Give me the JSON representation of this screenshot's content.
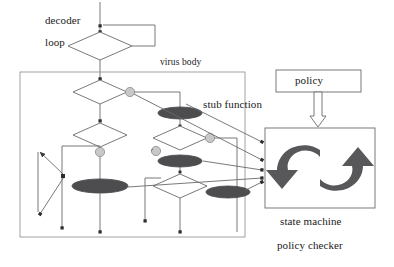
{
  "diagram": {
    "type": "flowchart",
    "labels": {
      "decoder": "decoder",
      "loop": "loop",
      "virus_body": "virus body",
      "stub_function": "stub function",
      "policy": "policy",
      "state_machine": "state machine",
      "policy_checker": "policy checker"
    },
    "colors": {
      "line": "#58585a",
      "stroke_dark": "#2b2b2b",
      "ellipse_fill": "#4d4d4f",
      "circle_fill": "#bfbfbf",
      "box_fill": "#ffffff",
      "arrow_icon": "#58585a",
      "text": "#1a1a1a"
    },
    "nodes": {
      "decoder_loop_diamond": {
        "cx": 100,
        "cy": 46,
        "rx": 32,
        "ry": 14
      },
      "virus_body_box": {
        "x": 20,
        "y": 72,
        "w": 225,
        "h": 165
      },
      "policy_box": {
        "x": 276,
        "y": 70,
        "w": 85,
        "h": 22
      },
      "state_machine_box": {
        "x": 265,
        "y": 128,
        "w": 110,
        "h": 80
      },
      "diamonds": [
        {
          "id": "d1",
          "cx": 100,
          "cy": 92,
          "rx": 27,
          "ry": 12
        },
        {
          "id": "d2",
          "cx": 100,
          "cy": 135,
          "rx": 27,
          "ry": 12
        },
        {
          "id": "d3",
          "cx": 180,
          "cy": 132,
          "rx": 27,
          "ry": 12
        },
        {
          "id": "d4",
          "cx": 177,
          "cy": 190,
          "rx": 27,
          "ry": 12
        },
        {
          "id": "d5",
          "cx": 40,
          "cy": 195,
          "rx": 22,
          "ry": 11
        }
      ],
      "stub_ellipses": [
        {
          "id": "e1",
          "cx": 180,
          "cy": 113,
          "rx": 22,
          "ry": 6
        },
        {
          "id": "e2",
          "cx": 180,
          "cy": 157,
          "rx": 22,
          "ry": 6
        },
        {
          "id": "e3",
          "cx": 100,
          "cy": 186,
          "rx": 26,
          "ry": 7
        },
        {
          "id": "e4",
          "cx": 228,
          "cy": 192,
          "rx": 22,
          "ry": 6
        }
      ],
      "junction_circles": [
        {
          "id": "c1",
          "cx": 127,
          "cy": 92,
          "r": 5
        },
        {
          "id": "c2",
          "cx": 100,
          "cy": 152,
          "r": 5
        },
        {
          "id": "c3",
          "cx": 152,
          "cy": 146,
          "r": 5
        },
        {
          "id": "c4",
          "cx": 207,
          "cy": 147,
          "r": 5
        }
      ]
    },
    "edges_into_checker": 4
  }
}
